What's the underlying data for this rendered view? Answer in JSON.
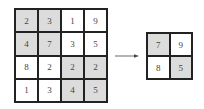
{
  "input_matrix": {
    "rows": [
      [
        {
          "v": "2",
          "hl": true
        },
        {
          "v": "3",
          "hl": true
        },
        {
          "v": "1",
          "hl": false
        },
        {
          "v": "9",
          "hl": false
        }
      ],
      [
        {
          "v": "4",
          "hl": true
        },
        {
          "v": "7",
          "hl": true
        },
        {
          "v": "3",
          "hl": false
        },
        {
          "v": "5",
          "hl": false
        }
      ],
      [
        {
          "v": "8",
          "hl": false
        },
        {
          "v": "2",
          "hl": false
        },
        {
          "v": "2",
          "hl": true
        },
        {
          "v": "2",
          "hl": true
        }
      ],
      [
        {
          "v": "1",
          "hl": false
        },
        {
          "v": "3",
          "hl": false
        },
        {
          "v": "4",
          "hl": true
        },
        {
          "v": "5",
          "hl": true
        }
      ]
    ]
  },
  "output_matrix": {
    "rows": [
      [
        {
          "v": "7",
          "hl": true
        },
        {
          "v": "9",
          "hl": false
        }
      ],
      [
        {
          "v": "8",
          "hl": false
        },
        {
          "v": "5",
          "hl": true
        }
      ]
    ]
  },
  "colors": {
    "highlight": "#dcdcdc",
    "border": "#222222",
    "text": "#444444"
  }
}
